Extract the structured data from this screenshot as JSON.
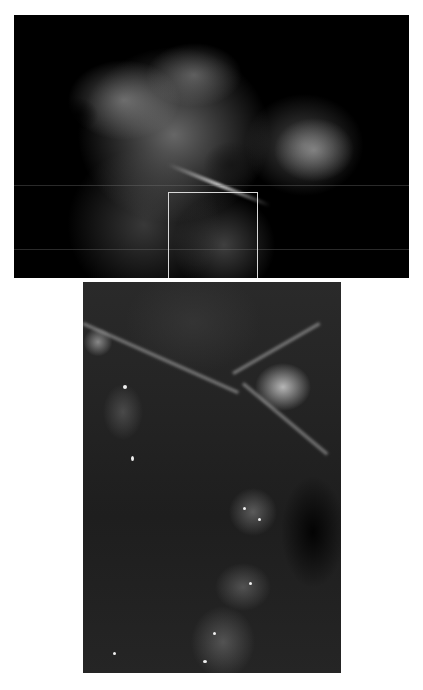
{
  "figure": {
    "overview": {
      "description": "Mammogram overview with rectangular region of interest",
      "roi_box_color": "#d8d8d8"
    },
    "detail": {
      "description": "Magnified view of the region of interest showing fibrous strands and clustered bright specks"
    }
  }
}
